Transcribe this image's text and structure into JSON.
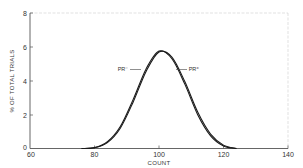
{
  "chart_data": {
    "type": "line",
    "title": "",
    "xlabel": "COUNT",
    "ylabel": "% OF TOTAL TRIALS",
    "xlim": [
      60,
      140
    ],
    "ylim": [
      0,
      8
    ],
    "x_ticks": [
      60,
      80,
      100,
      120,
      140
    ],
    "y_ticks": [
      0,
      2,
      4,
      6,
      8
    ],
    "grid": false,
    "legend": "inline annotations",
    "series": [
      {
        "name": "PR⁻",
        "label": "PR⁻",
        "x": [
          76,
          80,
          84,
          88,
          92,
          96,
          100,
          104,
          108,
          112,
          116,
          120,
          124
        ],
        "values": [
          0.0,
          0.05,
          0.4,
          1.3,
          2.9,
          4.7,
          5.75,
          5.3,
          3.8,
          2.0,
          0.75,
          0.15,
          0.0
        ]
      },
      {
        "name": "PR⁺",
        "label": "PR⁺",
        "x": [
          76,
          80,
          84,
          88,
          92,
          96,
          100,
          104,
          108,
          112,
          116,
          120,
          124
        ],
        "values": [
          0.0,
          0.04,
          0.35,
          1.2,
          2.75,
          4.55,
          5.7,
          5.4,
          3.95,
          2.15,
          0.85,
          0.2,
          0.0
        ]
      }
    ],
    "annotations": [
      {
        "text": "PR⁻",
        "points_to": "PR⁻",
        "side": "left"
      },
      {
        "text": "PR⁺",
        "points_to": "PR⁺",
        "side": "right"
      }
    ]
  },
  "axes": {
    "x_label": "COUNT",
    "y_label": "% OF TOTAL TRIALS",
    "x_tick_labels": [
      "60",
      "80",
      "100",
      "120",
      "140"
    ],
    "y_tick_labels": [
      "0",
      "2",
      "4",
      "6",
      "8"
    ]
  },
  "labels": {
    "pr_minus": "PR⁻",
    "pr_plus": "PR⁺"
  }
}
